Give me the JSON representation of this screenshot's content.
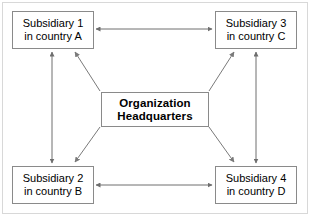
{
  "diagram": {
    "background_color": "#ffffff",
    "frame_color": "#d8d8d8",
    "box_border_color": "#8a8a8a",
    "arrow_color": "#6e6e6e",
    "text_color": "#000000"
  },
  "nodes": {
    "headquarters": {
      "line1": "Organization",
      "line2": "Headquarters"
    },
    "subsidiary1": {
      "line1": "Subsidiary 1",
      "line2": "in country A"
    },
    "subsidiary2": {
      "line1": "Subsidiary 2",
      "line2": "in country B"
    },
    "subsidiary3": {
      "line1": "Subsidiary 3",
      "line2": "in country C"
    },
    "subsidiary4": {
      "line1": "Subsidiary 4",
      "line2": "in country D"
    }
  },
  "connectors": [
    {
      "name": "sub1-sub3-horizontal",
      "from": "subsidiary1",
      "to": "subsidiary3",
      "style": "double-headed",
      "orientation": "horizontal"
    },
    {
      "name": "sub2-sub4-horizontal",
      "from": "subsidiary2",
      "to": "subsidiary4",
      "style": "double-headed",
      "orientation": "horizontal"
    },
    {
      "name": "sub1-sub2-vertical",
      "from": "subsidiary1",
      "to": "subsidiary2",
      "style": "double-headed",
      "orientation": "vertical"
    },
    {
      "name": "sub3-sub4-vertical",
      "from": "subsidiary3",
      "to": "subsidiary4",
      "style": "double-headed",
      "orientation": "vertical"
    },
    {
      "name": "hq-to-sub1-diagonal",
      "from": "headquarters",
      "to": "subsidiary1",
      "style": "single-headed",
      "orientation": "diagonal"
    },
    {
      "name": "hq-to-sub3-diagonal",
      "from": "headquarters",
      "to": "subsidiary3",
      "style": "single-headed",
      "orientation": "diagonal"
    },
    {
      "name": "hq-to-sub2-diagonal",
      "from": "headquarters",
      "to": "subsidiary2",
      "style": "single-headed",
      "orientation": "diagonal"
    },
    {
      "name": "hq-to-sub4-diagonal",
      "from": "headquarters",
      "to": "subsidiary4",
      "style": "single-headed",
      "orientation": "diagonal"
    }
  ]
}
